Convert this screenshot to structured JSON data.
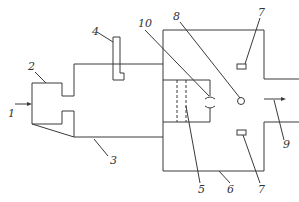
{
  "diagram": {
    "type": "schematic apparatus diagram",
    "labels": [
      {
        "id": "1",
        "text": "1",
        "x": 8,
        "y": 117
      },
      {
        "id": "2",
        "text": "2",
        "x": 28,
        "y": 70
      },
      {
        "id": "3",
        "text": "3",
        "x": 110,
        "y": 164
      },
      {
        "id": "4",
        "text": "4",
        "x": 92,
        "y": 35
      },
      {
        "id": "5",
        "text": "5",
        "x": 198,
        "y": 193
      },
      {
        "id": "6",
        "text": "6",
        "x": 227,
        "y": 193
      },
      {
        "id": "7a",
        "text": "7",
        "x": 258,
        "y": 16
      },
      {
        "id": "7b",
        "text": "7",
        "x": 258,
        "y": 193
      },
      {
        "id": "8",
        "text": "8",
        "x": 173,
        "y": 20
      },
      {
        "id": "9",
        "text": "9",
        "x": 283,
        "y": 148
      },
      {
        "id": "10",
        "text": "10",
        "x": 138,
        "y": 27
      }
    ],
    "arrows": {
      "inlet": "1",
      "outlet": "9"
    }
  }
}
